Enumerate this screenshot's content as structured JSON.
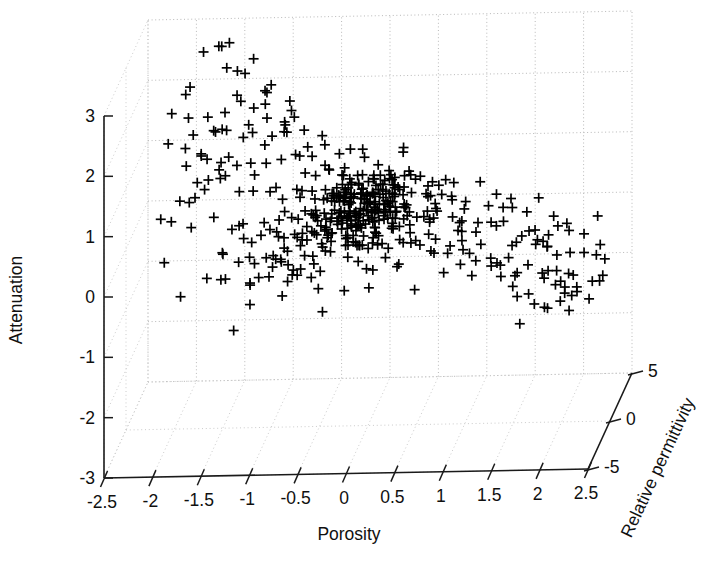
{
  "chart_data": {
    "type": "scatter",
    "projection": "3d",
    "title": "",
    "subtitle": "",
    "marker": "plus",
    "marker_color": "#000000",
    "grid": true,
    "legend": null,
    "legend_position": "none",
    "xlabel": "Porosity",
    "ylabel": "Attenuation",
    "zlabel": "Relative permittivity",
    "xlim": [
      -2.5,
      2.5
    ],
    "ylim": [
      -3,
      3
    ],
    "zlim": [
      -5,
      5
    ],
    "xticks": [
      "-2.5",
      "-2",
      "-1.5",
      "-1",
      "-0.5",
      "0",
      "0.5",
      "1",
      "1.5",
      "2",
      "2.5"
    ],
    "xtick_values": [
      -2.5,
      -2,
      -1.5,
      -1,
      -0.5,
      0,
      0.5,
      1,
      1.5,
      2,
      2.5
    ],
    "yticks": [
      "3",
      "2",
      "1",
      "0",
      "-1",
      "-2",
      "-3"
    ],
    "ytick_values": [
      3,
      2,
      1,
      0,
      -1,
      -2,
      -3
    ],
    "zticks": [
      "5",
      "0",
      "-5"
    ],
    "ztick_values": [
      5,
      0,
      -5
    ],
    "n_points": 520,
    "points": [
      [
        -1.92,
        2.38,
        1.8
      ],
      [
        -1.86,
        2.62,
        -0.5
      ],
      [
        -1.74,
        3.1,
        0.9
      ],
      [
        -1.71,
        2.2,
        -2.1
      ],
      [
        -1.62,
        2.95,
        2.4
      ],
      [
        -1.6,
        2.35,
        -1.2
      ],
      [
        -1.55,
        3.3,
        0.2
      ],
      [
        -1.5,
        3.15,
        1.5
      ],
      [
        -1.47,
        2.08,
        -0.8
      ],
      [
        -1.44,
        2.6,
        2.0
      ],
      [
        -1.4,
        2.5,
        -1.7
      ],
      [
        -1.38,
        2.42,
        0.6
      ],
      [
        -1.35,
        3.35,
        -2.4
      ],
      [
        -1.32,
        2.7,
        1.1
      ],
      [
        -1.3,
        2.46,
        -0.3
      ],
      [
        -1.28,
        1.95,
        2.2
      ],
      [
        -1.22,
        2.05,
        -1.5
      ],
      [
        -1.2,
        3.05,
        0.4
      ],
      [
        -1.15,
        2.28,
        1.9
      ],
      [
        -1.12,
        1.7,
        -2.0
      ],
      [
        -1.08,
        2.0,
        0.8
      ],
      [
        -1.05,
        1.62,
        1.3
      ],
      [
        -1.02,
        2.5,
        -0.9
      ],
      [
        -0.98,
        1.5,
        2.5
      ],
      [
        -0.95,
        2.85,
        -1.1
      ],
      [
        -0.9,
        1.42,
        0.1
      ],
      [
        -0.88,
        2.15,
        1.6
      ],
      [
        -0.85,
        1.32,
        -2.2
      ],
      [
        -2.05,
        2.15,
        0.5
      ],
      [
        -2.0,
        1.95,
        -1.4
      ],
      [
        -1.95,
        1.82,
        2.1
      ],
      [
        -1.9,
        1.6,
        0.3
      ],
      [
        -1.85,
        1.45,
        -0.6
      ],
      [
        -1.8,
        1.25,
        1.7
      ],
      [
        -1.76,
        1.05,
        -1.9
      ],
      [
        -1.72,
        0.85,
        0.7
      ],
      [
        -1.68,
        1.55,
        2.3
      ],
      [
        -1.64,
        1.15,
        -0.2
      ],
      [
        -1.58,
        0.95,
        1.2
      ],
      [
        -1.52,
        0.75,
        -1.6
      ],
      [
        -1.48,
        1.35,
        0.9
      ],
      [
        -1.42,
        0.6,
        2.0
      ],
      [
        -1.36,
        0.45,
        -1.0
      ],
      [
        -1.3,
        0.35,
        0.2
      ],
      [
        -1.25,
        0.7,
        1.4
      ],
      [
        -1.18,
        0.5,
        -2.3
      ],
      [
        -1.1,
        0.3,
        0.6
      ],
      [
        -1.0,
        0.15,
        1.8
      ],
      [
        -0.92,
        0.05,
        -1.3
      ],
      [
        -0.85,
        -0.15,
        0.4
      ],
      [
        -0.78,
        -0.25,
        2.2
      ],
      [
        -0.7,
        0.25,
        -0.7
      ],
      [
        -0.62,
        -0.35,
        1.1
      ],
      [
        -0.55,
        0.6,
        -1.8
      ],
      [
        -0.48,
        1.2,
        0.8
      ],
      [
        -0.9,
        1.85,
        1.0
      ],
      [
        -0.82,
        1.95,
        -0.4
      ],
      [
        -0.75,
        1.6,
        2.0
      ],
      [
        -0.68,
        1.75,
        -1.5
      ],
      [
        -0.6,
        1.4,
        0.5
      ],
      [
        -0.55,
        1.55,
        1.7
      ],
      [
        -0.5,
        1.3,
        -0.9
      ],
      [
        -0.45,
        1.65,
        0.1
      ],
      [
        -0.4,
        1.15,
        2.3
      ],
      [
        -0.35,
        1.45,
        -1.2
      ],
      [
        -0.3,
        1.05,
        0.7
      ],
      [
        -0.25,
        1.35,
        1.5
      ],
      [
        -0.2,
        0.95,
        -0.5
      ],
      [
        -0.15,
        1.25,
        2.1
      ],
      [
        -0.1,
        1.1,
        -1.7
      ],
      [
        -0.05,
        1.4,
        0.3
      ],
      [
        0.0,
        0.9,
        1.2
      ],
      [
        0.05,
        1.2,
        -1.0
      ],
      [
        0.1,
        1.05,
        0.6
      ],
      [
        0.15,
        0.85,
        1.9
      ],
      [
        0.2,
        1.15,
        -0.6
      ],
      [
        0.25,
        0.95,
        0.2
      ],
      [
        0.3,
        1.3,
        1.4
      ],
      [
        0.35,
        0.75,
        -1.4
      ],
      [
        0.4,
        1.0,
        0.9
      ],
      [
        0.45,
        0.8,
        2.0
      ],
      [
        0.5,
        1.1,
        -0.2
      ],
      [
        0.55,
        0.65,
        1.1
      ],
      [
        -0.7,
        0.85,
        0.4
      ],
      [
        -0.65,
        0.65,
        1.6
      ],
      [
        -0.6,
        0.75,
        -1.1
      ],
      [
        -0.55,
        0.55,
        0.2
      ],
      [
        -0.5,
        0.9,
        2.2
      ],
      [
        -0.45,
        0.45,
        -0.8
      ],
      [
        -0.4,
        0.7,
        1.0
      ],
      [
        -0.35,
        0.6,
        -1.9
      ],
      [
        -0.3,
        0.4,
        0.5
      ],
      [
        -0.25,
        0.75,
        1.8
      ],
      [
        -0.2,
        0.5,
        -0.4
      ],
      [
        -0.15,
        0.3,
        1.3
      ],
      [
        -0.1,
        0.65,
        -1.6
      ],
      [
        -0.05,
        0.45,
        0.8
      ],
      [
        0.0,
        0.25,
        2.1
      ],
      [
        0.05,
        0.55,
        -0.9
      ],
      [
        0.1,
        0.35,
        0.3
      ],
      [
        0.15,
        0.6,
        1.5
      ],
      [
        0.2,
        0.2,
        -1.2
      ],
      [
        0.25,
        0.5,
        0.7
      ],
      [
        0.3,
        0.3,
        1.9
      ],
      [
        0.35,
        0.15,
        -0.5
      ],
      [
        0.4,
        0.45,
        0.1
      ],
      [
        0.45,
        0.25,
        1.2
      ],
      [
        0.5,
        0.55,
        -1.5
      ],
      [
        0.55,
        0.35,
        0.6
      ],
      [
        0.6,
        0.15,
        1.7
      ],
      [
        0.65,
        0.4,
        -0.3
      ],
      [
        -0.6,
        0.05,
        1.0
      ],
      [
        -0.5,
        -0.1,
        -1.3
      ],
      [
        -0.4,
        0.0,
        0.4
      ],
      [
        -0.3,
        -0.2,
        2.0
      ],
      [
        -0.2,
        0.1,
        -0.7
      ],
      [
        -0.1,
        -0.15,
        0.9
      ],
      [
        0.0,
        -0.05,
        1.6
      ],
      [
        0.1,
        -0.25,
        -1.1
      ],
      [
        0.2,
        -0.1,
        0.2
      ],
      [
        0.3,
        -0.2,
        1.4
      ],
      [
        0.4,
        -0.05,
        -1.8
      ],
      [
        0.5,
        -0.15,
        0.8
      ],
      [
        0.6,
        -0.3,
        1.1
      ],
      [
        0.7,
        -0.1,
        -0.4
      ],
      [
        0.8,
        -0.25,
        0.5
      ],
      [
        0.9,
        -0.4,
        1.8
      ],
      [
        1.0,
        -0.2,
        -1.0
      ],
      [
        1.1,
        -0.35,
        0.3
      ],
      [
        1.2,
        -0.5,
        1.5
      ],
      [
        1.3,
        -0.3,
        -0.6
      ],
      [
        0.7,
        0.85,
        0.7
      ],
      [
        0.8,
        0.7,
        1.9
      ],
      [
        0.9,
        0.9,
        -0.8
      ],
      [
        1.0,
        0.65,
        0.2
      ],
      [
        1.1,
        0.8,
        1.3
      ],
      [
        1.2,
        0.55,
        -1.4
      ],
      [
        1.3,
        0.7,
        0.6
      ],
      [
        1.4,
        0.45,
        1.7
      ],
      [
        1.5,
        0.6,
        -0.2
      ],
      [
        1.6,
        0.35,
        0.9
      ],
      [
        1.7,
        0.5,
        1.4
      ],
      [
        1.8,
        0.2,
        -1.1
      ],
      [
        1.9,
        0.35,
        0.4
      ],
      [
        2.0,
        0.1,
        1.2
      ],
      [
        2.1,
        0.25,
        -0.5
      ],
      [
        2.2,
        0.0,
        0.7
      ],
      [
        2.3,
        0.15,
        1.6
      ],
      [
        2.4,
        -0.1,
        -0.9
      ],
      [
        1.35,
        -0.65,
        0.5
      ],
      [
        1.45,
        -0.8,
        1.5
      ],
      [
        1.55,
        -0.55,
        -1.2
      ],
      [
        1.65,
        -0.9,
        0.2
      ],
      [
        1.75,
        -0.7,
        1.1
      ],
      [
        1.85,
        -1.0,
        -0.6
      ],
      [
        1.9,
        -0.85,
        0.8
      ],
      [
        1.95,
        -1.15,
        1.8
      ],
      [
        2.0,
        -0.95,
        -0.3
      ],
      [
        2.05,
        -1.25,
        0.6
      ],
      [
        2.1,
        -1.05,
        1.3
      ],
      [
        2.15,
        -0.75,
        -1.0
      ],
      [
        1.7,
        -1.1,
        0.4
      ],
      [
        1.8,
        -1.3,
        1.2
      ],
      [
        1.6,
        -1.25,
        -0.7
      ],
      [
        1.5,
        -1.05,
        0.9
      ],
      [
        -2.15,
        0.45,
        0.2
      ],
      [
        -2.1,
        0.2,
        1.5
      ],
      [
        -2.05,
        -0.05,
        -1.2
      ],
      [
        -1.98,
        0.65,
        0.8
      ],
      [
        -1.55,
        -0.25,
        1.0
      ],
      [
        -1.45,
        -0.45,
        -0.5
      ],
      [
        -1.35,
        -0.3,
        0.3
      ],
      [
        -1.25,
        -0.55,
        1.7
      ],
      [
        -1.15,
        -0.4,
        -1.5
      ],
      [
        -1.05,
        -0.6,
        0.6
      ],
      [
        -0.95,
        -0.45,
        1.2
      ],
      [
        -0.85,
        -0.7,
        -0.8
      ],
      [
        -0.75,
        -0.55,
        0.4
      ],
      [
        -0.65,
        -0.75,
        1.4
      ],
      [
        -0.2,
        -0.6,
        -1.0
      ],
      [
        0.0,
        -0.75,
        0.2
      ],
      [
        0.25,
        -0.55,
        1.1
      ],
      [
        0.5,
        -0.7,
        -0.4
      ],
      [
        0.75,
        -0.6,
        0.7
      ],
      [
        1.0,
        -0.8,
        1.6
      ]
    ]
  },
  "axes": {
    "x_label": "Porosity",
    "y_label": "Attenuation",
    "z_label": "Relative permittivity",
    "x_ticklabels": [
      "-2.5",
      "-2",
      "-1.5",
      "-1",
      "-0.5",
      "0",
      "0.5",
      "1",
      "1.5",
      "2",
      "2.5"
    ],
    "y_ticklabels": [
      "3",
      "2",
      "1",
      "0",
      "-1",
      "-2",
      "-3"
    ],
    "z_ticklabels": [
      "5",
      "0",
      "-5"
    ]
  },
  "style": {
    "background": "#ffffff",
    "axis_color": "#1a1a1a",
    "grid_color": "#b9b9b9",
    "marker_color": "#000000"
  }
}
